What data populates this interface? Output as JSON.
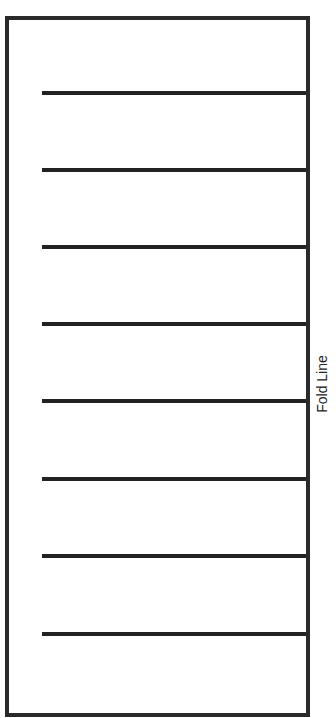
{
  "diagram": {
    "fold_label": "Fold Line",
    "line_count": 8,
    "line_positions_y": [
      93,
      170,
      247,
      324,
      401,
      479,
      556,
      634
    ],
    "colors": {
      "stroke": "#222222",
      "background": "#ffffff"
    }
  }
}
